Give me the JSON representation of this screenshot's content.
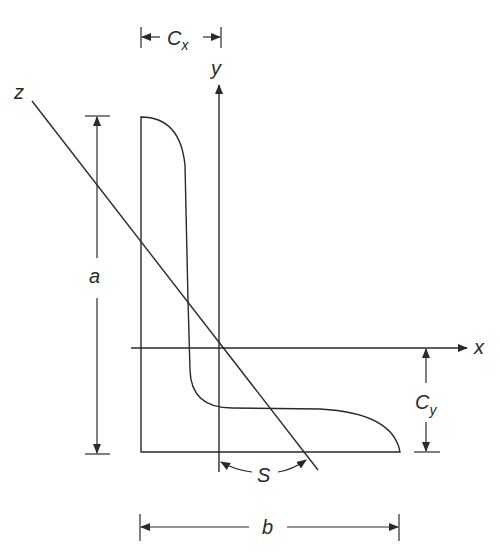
{
  "figure": {
    "labels": {
      "cx_main": "C",
      "cx_sub": "x",
      "cy_main": "C",
      "cy_sub": "y",
      "y_axis": "y",
      "x_axis": "x",
      "z_axis": "z",
      "a_dim": "a",
      "b_dim": "b",
      "s_dim": "S"
    },
    "colors": {
      "stroke": "#2a2a2a",
      "background": "#ffffff"
    }
  }
}
